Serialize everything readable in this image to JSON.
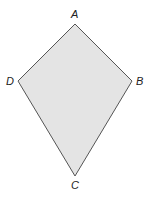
{
  "figure": {
    "shape": "kite",
    "fill_color": "#e4e4e4",
    "stroke_color": "#555555",
    "vertices": [
      {
        "label": "A",
        "x": 75,
        "y": 24
      },
      {
        "label": "B",
        "x": 132,
        "y": 81
      },
      {
        "label": "C",
        "x": 75,
        "y": 176
      },
      {
        "label": "D",
        "x": 18,
        "y": 81
      }
    ],
    "labels": {
      "A": "A",
      "B": "B",
      "C": "C",
      "D": "D"
    }
  }
}
